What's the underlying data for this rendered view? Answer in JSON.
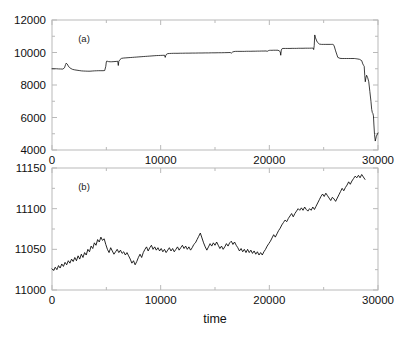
{
  "figure": {
    "background": "#ffffff",
    "line_color": "#000000",
    "axis_color": "#b9b9b9",
    "xlabel": "time"
  },
  "chart_data": [
    {
      "type": "line",
      "panel": "(a)",
      "title": "",
      "xlabel": "",
      "ylabel": "",
      "xlim": [
        0,
        30000
      ],
      "ylim": [
        4000,
        12000
      ],
      "xticks": [
        0,
        10000,
        20000,
        30000
      ],
      "xticklabels": [
        "0",
        "10000",
        "20000",
        "30000"
      ],
      "xminorticks": [
        5000,
        15000,
        25000
      ],
      "yticks": [
        4000,
        6000,
        8000,
        10000,
        12000
      ],
      "yticklabels": [
        "4000",
        "6000",
        "8000",
        "10000",
        "12000"
      ],
      "yminorticks": [
        5000,
        7000,
        9000,
        11000
      ],
      "grid": false,
      "legend": "none",
      "series": [
        {
          "name": "signal-a",
          "x": [
            0,
            200,
            400,
            600,
            800,
            1000,
            1150,
            1250,
            1300,
            1400,
            1500,
            1600,
            1750,
            1900,
            2100,
            2300,
            2500,
            2700,
            2900,
            3100,
            3300,
            3500,
            3700,
            3900,
            4100,
            4300,
            4500,
            4700,
            4850,
            4950,
            5000,
            5050,
            5100,
            5200,
            5350,
            5500,
            5700,
            5900,
            6050,
            6100,
            6150,
            6250,
            6400,
            6600,
            6800,
            7000,
            7200,
            7400,
            7600,
            7800,
            8000,
            8200,
            8400,
            8600,
            8800,
            9000,
            9200,
            9400,
            9600,
            9800,
            10000,
            10200,
            10350,
            10420,
            10480,
            10550,
            10650,
            10800,
            11000,
            11200,
            11400,
            11600,
            11800,
            12000,
            12300,
            12600,
            12900,
            13200,
            13500,
            13800,
            14100,
            14400,
            14700,
            15000,
            15300,
            15600,
            15900,
            16200,
            16400,
            16500,
            16600,
            16750,
            16900,
            17100,
            17300,
            17500,
            17700,
            17900,
            18100,
            18300,
            18500,
            18700,
            18900,
            19100,
            19300,
            19500,
            19700,
            19800,
            19900,
            20000,
            20100,
            20250,
            20400,
            20600,
            20800,
            20900,
            21000,
            21050,
            21100,
            21180,
            21250,
            21350,
            21500,
            21700,
            21900,
            22100,
            22300,
            22500,
            22700,
            22900,
            23100,
            23300,
            23500,
            23700,
            23900,
            23980,
            24030,
            24080,
            24130,
            24180,
            24250,
            24400,
            24600,
            24800,
            25000,
            25200,
            25400,
            25600,
            25700,
            25780,
            25850,
            25950,
            26100,
            26300,
            26500,
            26700,
            26900,
            27100,
            27300,
            27500,
            27700,
            27850,
            27950,
            28050,
            28150,
            28300,
            28500,
            28600,
            28680,
            28730,
            28780,
            28830,
            28880,
            28950,
            29050,
            29150,
            29250,
            29350,
            29420,
            29480,
            29530,
            29580,
            29620,
            29680,
            29750,
            29850,
            30000
          ],
          "y": [
            9000,
            9000,
            9000,
            8990,
            8985,
            8980,
            9060,
            9260,
            9340,
            9290,
            9170,
            9080,
            9010,
            8960,
            8930,
            8910,
            8890,
            8870,
            8860,
            8855,
            8850,
            8850,
            8860,
            8870,
            8875,
            8880,
            8880,
            8880,
            8890,
            9150,
            9420,
            9480,
            9460,
            9440,
            9430,
            9430,
            9440,
            9450,
            9460,
            9200,
            9460,
            9560,
            9640,
            9660,
            9670,
            9680,
            9690,
            9700,
            9710,
            9720,
            9730,
            9740,
            9750,
            9760,
            9770,
            9780,
            9790,
            9800,
            9810,
            9815,
            9820,
            9825,
            9830,
            9700,
            9830,
            9900,
            9930,
            9940,
            9945,
            9950,
            9950,
            9950,
            9955,
            9955,
            9960,
            9960,
            9965,
            9965,
            9970,
            9970,
            9975,
            9975,
            9980,
            9980,
            9985,
            9985,
            9990,
            9995,
            10000,
            9960,
            10020,
            10060,
            10070,
            10070,
            10070,
            10070,
            10070,
            10075,
            10075,
            10075,
            10080,
            10080,
            10085,
            10085,
            10090,
            10090,
            10095,
            10070,
            10110,
            10130,
            10135,
            10135,
            10140,
            10140,
            10140,
            10100,
            10050,
            9830,
            10150,
            10240,
            10250,
            10250,
            10250,
            10250,
            10250,
            10255,
            10255,
            10255,
            10260,
            10260,
            10260,
            10265,
            10265,
            10265,
            10270,
            10270,
            10270,
            10180,
            10420,
            11080,
            10900,
            10650,
            10520,
            10500,
            10500,
            10500,
            10500,
            10500,
            10500,
            10500,
            10500,
            10440,
            10100,
            9700,
            9640,
            9630,
            9630,
            9630,
            9630,
            9630,
            9630,
            9630,
            9620,
            9610,
            9600,
            9580,
            9500,
            9300,
            9200,
            9150,
            8600,
            8200,
            8420,
            8600,
            8450,
            8200,
            7600,
            7000,
            6500,
            6300,
            6250,
            6100,
            5600,
            4950,
            4550,
            4850,
            5050,
            5060,
            5060,
            5060
          ]
        }
      ]
    },
    {
      "type": "line",
      "panel": "(b)",
      "title": "",
      "xlabel": "time",
      "ylabel": "",
      "xlim": [
        0,
        30000
      ],
      "ylim": [
        11000,
        11150
      ],
      "xticks": [
        0,
        10000,
        20000,
        30000
      ],
      "xticklabels": [
        "0",
        "10000",
        "20000",
        "30000"
      ],
      "xminorticks": [
        5000,
        15000,
        25000
      ],
      "yticks": [
        11000,
        11050,
        11100,
        11150
      ],
      "yticklabels": [
        "11000",
        "11050",
        "11100",
        "11150"
      ],
      "yminorticks": [
        11025,
        11075,
        11125
      ],
      "grid": false,
      "legend": "none",
      "series": [
        {
          "name": "signal-b",
          "x": [
            0,
            150,
            300,
            450,
            600,
            750,
            900,
            1050,
            1200,
            1350,
            1500,
            1650,
            1800,
            1950,
            2100,
            2250,
            2400,
            2550,
            2700,
            2850,
            3000,
            3150,
            3300,
            3450,
            3600,
            3750,
            3900,
            4050,
            4200,
            4350,
            4500,
            4650,
            4800,
            4950,
            5100,
            5250,
            5400,
            5550,
            5700,
            5850,
            6000,
            6150,
            6300,
            6450,
            6600,
            6750,
            6900,
            7050,
            7200,
            7350,
            7500,
            7650,
            7800,
            7950,
            8100,
            8250,
            8400,
            8550,
            8700,
            8850,
            9000,
            9150,
            9300,
            9450,
            9600,
            9750,
            9900,
            10050,
            10200,
            10350,
            10500,
            10650,
            10800,
            10950,
            11100,
            11250,
            11400,
            11550,
            11700,
            11850,
            12000,
            12150,
            12300,
            12450,
            12600,
            12750,
            12900,
            13050,
            13200,
            13350,
            13500,
            13650,
            13800,
            13950,
            14100,
            14250,
            14400,
            14550,
            14700,
            14850,
            15000,
            15150,
            15300,
            15450,
            15600,
            15750,
            15900,
            16050,
            16200,
            16350,
            16500,
            16650,
            16800,
            16950,
            17100,
            17250,
            17400,
            17550,
            17700,
            17850,
            18000,
            18150,
            18300,
            18450,
            18600,
            18750,
            18900,
            19050,
            19200,
            19350,
            19500,
            19650,
            19800,
            19950,
            20100,
            20250,
            20400,
            20550,
            20700,
            20850,
            21000,
            21150,
            21300,
            21450,
            21600,
            21750,
            21900,
            22050,
            22200,
            22350,
            22500,
            22650,
            22800,
            22950,
            23100,
            23250,
            23400,
            23550,
            23700,
            23850,
            24000,
            24150,
            24300,
            24450,
            24600,
            24750,
            24900,
            25050,
            25200,
            25350,
            25500,
            25650,
            25800,
            25950,
            26100,
            26250,
            26400,
            26550,
            26700,
            26850,
            27000,
            27150,
            27300,
            27450,
            27600,
            27750,
            27900,
            28050,
            28200,
            28350,
            28500,
            28650,
            28800,
            28950,
            29100,
            29250,
            29400,
            29550,
            29700,
            29850,
            30000
          ],
          "y": [
            11026,
            11024,
            11028,
            11025,
            11030,
            11027,
            11032,
            11029,
            11034,
            11031,
            11036,
            11033,
            11038,
            11035,
            11040,
            11036,
            11042,
            11038,
            11044,
            11040,
            11046,
            11043,
            11050,
            11047,
            11054,
            11051,
            11058,
            11055,
            11062,
            11059,
            11065,
            11061,
            11063,
            11056,
            11050,
            11046,
            11052,
            11048,
            11044,
            11047,
            11050,
            11046,
            11049,
            11045,
            11047,
            11043,
            11046,
            11042,
            11038,
            11033,
            11036,
            11031,
            11035,
            11040,
            11044,
            11040,
            11046,
            11050,
            11053,
            11048,
            11052,
            11055,
            11050,
            11053,
            11049,
            11052,
            11048,
            11051,
            11047,
            11050,
            11046,
            11049,
            11052,
            11048,
            11051,
            11047,
            11050,
            11053,
            11049,
            11052,
            11055,
            11051,
            11054,
            11050,
            11053,
            11049,
            11052,
            11056,
            11058,
            11062,
            11066,
            11070,
            11064,
            11058,
            11053,
            11049,
            11053,
            11057,
            11054,
            11058,
            11055,
            11059,
            11055,
            11051,
            11054,
            11050,
            11053,
            11057,
            11054,
            11058,
            11060,
            11056,
            11059,
            11055,
            11052,
            11048,
            11051,
            11047,
            11050,
            11046,
            11050,
            11046,
            11049,
            11045,
            11048,
            11044,
            11047,
            11043,
            11046,
            11043,
            11047,
            11050,
            11054,
            11057,
            11060,
            11064,
            11068,
            11065,
            11069,
            11073,
            11076,
            11080,
            11083,
            11086,
            11084,
            11088,
            11091,
            11094,
            11090,
            11094,
            11097,
            11100,
            11098,
            11101,
            11098,
            11102,
            11099,
            11097,
            11100,
            11098,
            11102,
            11099,
            11103,
            11107,
            11111,
            11115,
            11118,
            11115,
            11119,
            11116,
            11113,
            11110,
            11114,
            11112,
            11109,
            11113,
            11117,
            11121,
            11125,
            11122,
            11126,
            11129,
            11133,
            11130,
            11134,
            11137,
            11140,
            11138,
            11141,
            11138,
            11142,
            11139,
            11136
          ]
        }
      ]
    }
  ]
}
